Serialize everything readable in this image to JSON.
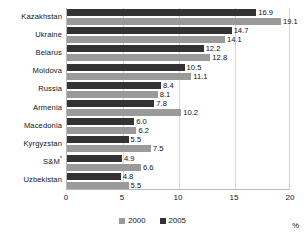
{
  "chart_data": {
    "type": "bar",
    "orientation": "horizontal",
    "title": "",
    "xlabel": "%",
    "ylabel": "",
    "xlim": [
      0,
      20
    ],
    "xticks": [
      "0",
      "5",
      "10",
      "15",
      "20"
    ],
    "grid": true,
    "legend_position": "bottom-center",
    "categories": [
      "Kazakhstan",
      "Ukraine",
      "Belarus",
      "Moldova",
      "Russia",
      "Armenia",
      "Macedonia",
      "Kyrgyzstan",
      "S&M",
      "Uzbekistan"
    ],
    "category_footnote_marks": {
      "S&M": "*"
    },
    "series": [
      {
        "name": "2000",
        "color": "#9a9a9a",
        "values": [
          19.1,
          14.1,
          12.8,
          11.1,
          8.1,
          10.2,
          6.2,
          7.5,
          6.6,
          5.5
        ],
        "labels": [
          "19.1",
          "14.1",
          "12.8",
          "11.1",
          "8.1",
          "10.2",
          "6.2",
          "7.5",
          "6.6",
          "5.5"
        ]
      },
      {
        "name": "2005",
        "color": "#333333",
        "values": [
          16.9,
          14.7,
          12.2,
          10.5,
          8.4,
          7.8,
          6.0,
          5.5,
          4.9,
          4.8
        ],
        "labels": [
          "16.9",
          "14.7",
          "12.2",
          "10.5",
          "8.4",
          "7.8",
          "6.0",
          "5.5",
          "4.9",
          "4.8"
        ]
      }
    ]
  },
  "legend": {
    "items": [
      {
        "label": "2000",
        "color": "#9a9a9a"
      },
      {
        "label": "2005",
        "color": "#333333"
      }
    ]
  },
  "unit": "%"
}
